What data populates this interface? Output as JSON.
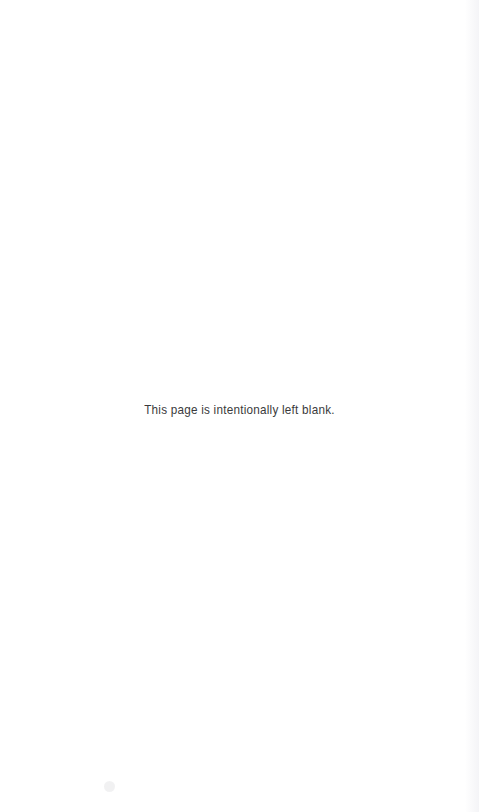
{
  "page": {
    "width": 479,
    "height": 812,
    "background_color": "#ffffff",
    "kind": "blank-filler-page"
  },
  "notice": {
    "text": "This page is intentionally left blank.",
    "color": "#3a3a3c",
    "alignment": "center"
  },
  "artifacts": {
    "right_edge_shadow": "scan-shadow",
    "speck": "scan-speck"
  }
}
